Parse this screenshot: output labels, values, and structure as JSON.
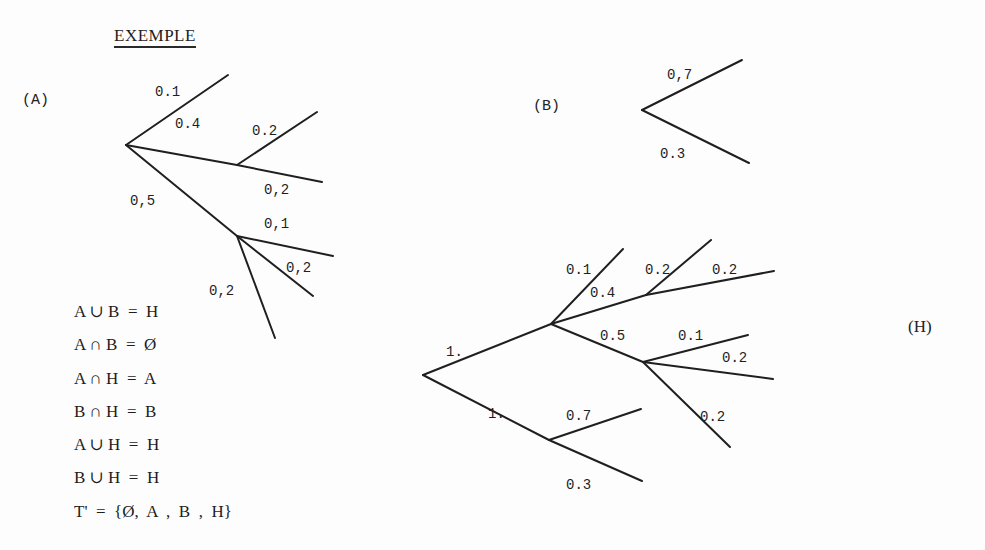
{
  "title": "EXEMPLE",
  "trees": {
    "A": {
      "tag": "(A)",
      "tag_pos": [
        22,
        92
      ],
      "edges": [
        {
          "from": [
            126,
            145
          ],
          "to": [
            228,
            75
          ],
          "label": "0.1",
          "label_pos": [
            155,
            96
          ]
        },
        {
          "from": [
            126,
            145
          ],
          "to": [
            237,
            165
          ],
          "label": "0.4",
          "label_pos": [
            175,
            128
          ]
        },
        {
          "from": [
            237,
            165
          ],
          "to": [
            317,
            112
          ],
          "label": "0.2",
          "label_pos": [
            252,
            135
          ]
        },
        {
          "from": [
            237,
            165
          ],
          "to": [
            322,
            182
          ],
          "label": "0,2",
          "label_pos": [
            264,
            194
          ]
        },
        {
          "from": [
            126,
            145
          ],
          "to": [
            237,
            236
          ],
          "label": "0,5",
          "label_pos": [
            130,
            205
          ]
        },
        {
          "from": [
            237,
            236
          ],
          "to": [
            333,
            256
          ],
          "label": "0,1",
          "label_pos": [
            264,
            228
          ]
        },
        {
          "from": [
            237,
            236
          ],
          "to": [
            313,
            296
          ],
          "label": "0,2",
          "label_pos": [
            286,
            272
          ]
        },
        {
          "from": [
            237,
            236
          ],
          "to": [
            275,
            338
          ],
          "label": "0,2",
          "label_pos": [
            209,
            295
          ]
        }
      ]
    },
    "B": {
      "tag": "(B)",
      "tag_pos": [
        533,
        98
      ],
      "edges": [
        {
          "from": [
            642,
            110
          ],
          "to": [
            742,
            60
          ],
          "label": "0,7",
          "label_pos": [
            667,
            79
          ]
        },
        {
          "from": [
            642,
            110
          ],
          "to": [
            749,
            163
          ],
          "label": "0.3",
          "label_pos": [
            660,
            158
          ]
        }
      ]
    },
    "H": {
      "tag": "(H)",
      "tag_pos": [
        908,
        317
      ],
      "edges": [
        {
          "from": [
            423,
            375
          ],
          "to": [
            551,
            324
          ],
          "label": "1.",
          "label_pos": [
            446,
            356
          ]
        },
        {
          "from": [
            551,
            324
          ],
          "to": [
            623,
            249
          ],
          "label": "0.1",
          "label_pos": [
            566,
            274
          ]
        },
        {
          "from": [
            551,
            324
          ],
          "to": [
            646,
            295
          ],
          "label": "0.4",
          "label_pos": [
            590,
            297
          ]
        },
        {
          "from": [
            646,
            295
          ],
          "to": [
            711,
            240
          ],
          "label": "0.2",
          "label_pos": [
            645,
            274
          ]
        },
        {
          "from": [
            646,
            295
          ],
          "to": [
            774,
            271
          ],
          "label": "0.2",
          "label_pos": [
            712,
            274
          ]
        },
        {
          "from": [
            551,
            324
          ],
          "to": [
            643,
            362
          ],
          "label": "0.5",
          "label_pos": [
            600,
            340
          ]
        },
        {
          "from": [
            643,
            362
          ],
          "to": [
            748,
            335
          ],
          "label": "0.1",
          "label_pos": [
            678,
            340
          ]
        },
        {
          "from": [
            643,
            362
          ],
          "to": [
            773,
            379
          ],
          "label": "0.2",
          "label_pos": [
            722,
            362
          ]
        },
        {
          "from": [
            643,
            362
          ],
          "to": [
            730,
            447
          ],
          "label": "0.2",
          "label_pos": [
            700,
            421
          ]
        },
        {
          "from": [
            423,
            375
          ],
          "to": [
            549,
            440
          ],
          "label": "1.",
          "label_pos": [
            488,
            418
          ]
        },
        {
          "from": [
            549,
            440
          ],
          "to": [
            641,
            409
          ],
          "label": "0.7",
          "label_pos": [
            566,
            420
          ]
        },
        {
          "from": [
            549,
            440
          ],
          "to": [
            642,
            481
          ],
          "label": "0.3",
          "label_pos": [
            566,
            489
          ]
        }
      ]
    }
  },
  "equations": [
    "A ∪ B  =  H",
    "A ∩ B  =  Ø",
    "A ∩ H  =  A",
    "B ∩ H  =  B",
    "A ∪ H  =  H",
    "B ∪ H  =  H",
    "T'  =  {Ø,  A  ,  B  ,  H}"
  ]
}
